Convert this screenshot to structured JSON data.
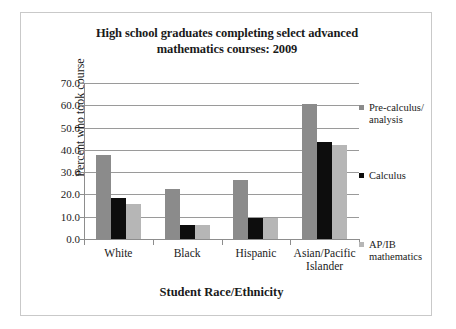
{
  "chart_data": {
    "type": "bar",
    "title": "High school graduates completing select advanced mathematics courses: 2009",
    "title_line1": "High school graduates completing select advanced",
    "title_line2": "mathematics courses: 2009",
    "xlabel": "Student Race/Ethnicity",
    "ylabel": "Percent who took course",
    "categories": [
      "White",
      "Black",
      "Hispanic",
      "Asian/Pacific Islander"
    ],
    "category_lines": [
      [
        "White"
      ],
      [
        "Black"
      ],
      [
        "Hispanic"
      ],
      [
        "Asian/Pacific",
        "Islander"
      ]
    ],
    "series": [
      {
        "name": "Pre-calculus/ analysis",
        "name_line1": "Pre-calculus/",
        "name_line2": "analysis",
        "color": "#8b8b8b",
        "values": [
          37.8,
          22.6,
          26.5,
          60.8
        ]
      },
      {
        "name": "Calculus",
        "name_line1": "Calculus",
        "name_line2": "",
        "color": "#0d0d0d",
        "values": [
          18.5,
          6.5,
          9.3,
          43.5
        ]
      },
      {
        "name": "AP/IB mathematics",
        "name_line1": "AP/IB",
        "name_line2": "mathematics",
        "color": "#b6b6b6",
        "values": [
          15.7,
          6.3,
          9.5,
          42.0
        ]
      }
    ],
    "ylim": [
      0.0,
      70.0
    ],
    "ytick_step": 10.0,
    "yticks": [
      "70.0",
      "60.0",
      "50.0",
      "40.0",
      "30.0",
      "20.0",
      "10.0",
      "0.0"
    ],
    "grid": true,
    "legend_position": "right"
  }
}
